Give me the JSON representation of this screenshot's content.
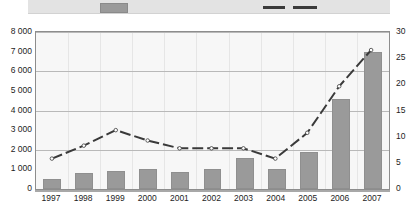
{
  "legend": {
    "bar_swatch": "bar-series-swatch",
    "line_swatch": "line-series-swatch",
    "bar_color": "#9a9a9a",
    "line_color": "#3a3a3a"
  },
  "axes": {
    "left_ticks": [
      "8 000",
      "7 000",
      "6 000",
      "5 000",
      "4 000",
      "3 000",
      "2 000",
      "1 000",
      "0"
    ],
    "right_ticks": [
      "30",
      "25",
      "20",
      "15",
      "10",
      "5",
      "0"
    ],
    "x_ticks": [
      "1997",
      "1998",
      "1999",
      "2000",
      "2001",
      "2002",
      "2003",
      "2004",
      "2005",
      "2006",
      "2007"
    ]
  },
  "chart_data": {
    "type": "bar",
    "title": "",
    "subtitle": "",
    "xlabel": "",
    "ylabel": "",
    "y2label": "",
    "grid": true,
    "legend_position": "top",
    "categories": [
      "1997",
      "1998",
      "1999",
      "2000",
      "2001",
      "2002",
      "2003",
      "2004",
      "2005",
      "2006",
      "2007"
    ],
    "ylim": [
      0,
      8000
    ],
    "y2lim": [
      0,
      30
    ],
    "yticks": [
      0,
      1000,
      2000,
      3000,
      4000,
      5000,
      6000,
      7000,
      8000
    ],
    "y2ticks": [
      0,
      5,
      10,
      15,
      20,
      25,
      30
    ],
    "gridline_values": [
      0,
      2000,
      4000,
      6000,
      8000
    ],
    "series": [
      {
        "name": "bar-series",
        "type": "bar",
        "axis": "left",
        "color": "#9a9a9a",
        "values": [
          500,
          800,
          900,
          1000,
          850,
          1000,
          1600,
          1000,
          1900,
          4600,
          7000
        ]
      },
      {
        "name": "line-series",
        "type": "line",
        "axis": "right",
        "color": "#3a3a3a",
        "dashed": true,
        "values": [
          5.5,
          8.0,
          11.0,
          9.0,
          7.5,
          7.5,
          7.5,
          5.5,
          10.5,
          19.5,
          26.5
        ]
      }
    ]
  }
}
